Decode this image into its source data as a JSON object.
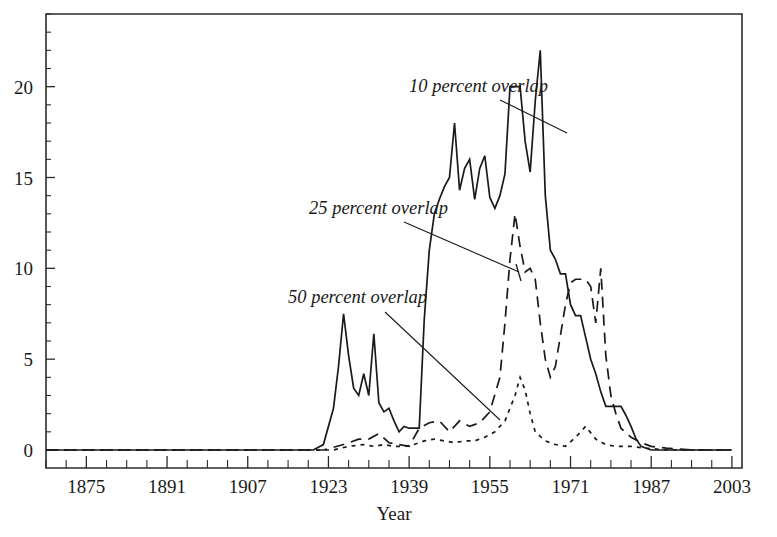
{
  "chart_data": {
    "type": "line",
    "title": "",
    "xlabel": "Year",
    "ylabel": "",
    "xlim": [
      1867,
      2005
    ],
    "ylim": [
      0,
      24
    ],
    "grid": false,
    "legend_position": "inline-annotations",
    "x_tick_labels": [
      "1875",
      "1891",
      "1907",
      "1923",
      "1939",
      "1955",
      "1971",
      "1987",
      "2003"
    ],
    "x_tick_values": [
      1875,
      1891,
      1907,
      1923,
      1939,
      1955,
      1971,
      1987,
      2003
    ],
    "x_minor_step": 4,
    "y_tick_labels": [
      "0",
      "5",
      "10",
      "15",
      "20"
    ],
    "y_tick_values": [
      0,
      5,
      10,
      15,
      20
    ],
    "y_minor_step": 1,
    "series": [
      {
        "name": "10 percent overlap",
        "style": "solid",
        "x": [
          1867,
          1875,
          1885,
          1895,
          1905,
          1915,
          1920,
          1922,
          1924,
          1925,
          1926,
          1927,
          1928,
          1929,
          1930,
          1931,
          1932,
          1933,
          1934,
          1935,
          1936,
          1937,
          1938,
          1939,
          1940,
          1941,
          1942,
          1943,
          1944,
          1945,
          1946,
          1947,
          1948,
          1949,
          1950,
          1951,
          1952,
          1953,
          1954,
          1955,
          1956,
          1957,
          1958,
          1959,
          1960,
          1961,
          1962,
          1963,
          1964,
          1965,
          1966,
          1967,
          1968,
          1969,
          1970,
          1971,
          1972,
          1973,
          1974,
          1975,
          1976,
          1977,
          1978,
          1979,
          1980,
          1981,
          1982,
          1983,
          1984,
          1985,
          1986,
          1987,
          1988,
          1989,
          1990,
          1991,
          1992,
          1993,
          1994,
          1995,
          1996,
          1997,
          1998,
          1999,
          2000,
          2003
        ],
        "y": [
          0,
          0,
          0,
          0,
          0,
          0,
          0,
          0.3,
          2.3,
          4.6,
          7.5,
          5.2,
          3.4,
          3.0,
          4.2,
          3.0,
          6.4,
          2.6,
          2.1,
          2.3,
          1.6,
          1.0,
          1.3,
          1.2,
          1.2,
          1.2,
          7.2,
          11.0,
          13.0,
          13.8,
          14.5,
          15.0,
          18.0,
          14.3,
          15.5,
          16.0,
          13.8,
          15.5,
          16.2,
          13.9,
          13.3,
          14.0,
          15.2,
          20.0,
          20.0,
          20.0,
          17.0,
          15.3,
          19.2,
          22.0,
          14.0,
          11.0,
          10.5,
          9.7,
          9.7,
          8.0,
          7.4,
          7.4,
          6.2,
          5.0,
          4.2,
          3.2,
          2.4,
          2.4,
          2.4,
          2.4,
          1.9,
          1.3,
          0.6,
          0.2,
          0.1,
          0,
          0,
          0,
          0,
          0,
          0,
          0,
          0,
          0,
          0,
          0,
          0,
          0,
          0,
          0
        ]
      },
      {
        "name": "25 percent overlap",
        "style": "dashed",
        "x": [
          1867,
          1880,
          1900,
          1915,
          1922,
          1926,
          1929,
          1931,
          1933,
          1935,
          1937,
          1939,
          1941,
          1943,
          1945,
          1947,
          1949,
          1951,
          1953,
          1955,
          1957,
          1958,
          1959,
          1960,
          1961,
          1962,
          1963,
          1964,
          1965,
          1966,
          1967,
          1968,
          1969,
          1970,
          1971,
          1972,
          1973,
          1974,
          1975,
          1976,
          1977,
          1978,
          1979,
          1980,
          1981,
          1983,
          1985,
          1987,
          1990,
          1995,
          2000,
          2003
        ],
        "y": [
          0,
          0,
          0,
          0,
          0,
          0.3,
          0.6,
          0.6,
          0.9,
          0.4,
          0.3,
          0.2,
          1.2,
          1.5,
          1.6,
          1.0,
          1.6,
          1.3,
          1.5,
          2.1,
          4.0,
          7.0,
          10.5,
          13.0,
          11.2,
          9.8,
          10.0,
          9.4,
          7.0,
          5.0,
          4.0,
          4.6,
          6.3,
          8.0,
          9.2,
          9.4,
          9.4,
          9.4,
          9.0,
          7.0,
          10.0,
          5.2,
          3.0,
          2.0,
          1.2,
          0.7,
          0.4,
          0.2,
          0.1,
          0,
          0,
          0
        ]
      },
      {
        "name": "50 percent overlap",
        "style": "dotted",
        "x": [
          1867,
          1885,
          1905,
          1920,
          1924,
          1927,
          1930,
          1932,
          1934,
          1936,
          1938,
          1940,
          1942,
          1944,
          1946,
          1948,
          1950,
          1952,
          1954,
          1956,
          1958,
          1960,
          1961,
          1962,
          1963,
          1964,
          1966,
          1968,
          1970,
          1972,
          1974,
          1976,
          1978,
          1980,
          1983,
          1986,
          1990,
          1995,
          2000,
          2003
        ],
        "y": [
          0,
          0,
          0,
          0,
          0,
          0.2,
          0.3,
          0.2,
          0.3,
          0.2,
          0.2,
          0.3,
          0.5,
          0.6,
          0.5,
          0.4,
          0.5,
          0.5,
          0.7,
          1.0,
          1.6,
          3.0,
          4.0,
          3.3,
          2.0,
          1.0,
          0.5,
          0.3,
          0.2,
          0.7,
          1.3,
          0.6,
          0.3,
          0.2,
          0.2,
          0.1,
          0,
          0,
          0,
          0
        ]
      }
    ],
    "annotations": [
      {
        "label": "10 percent overlap",
        "text_x": 409,
        "text_y": 92,
        "leader": [
          [
            500,
            100
          ],
          [
            567,
            133
          ]
        ],
        "cap": null
      },
      {
        "label": "25 percent overlap",
        "text_x": 309,
        "text_y": 214,
        "leader": [
          [
            404,
            222
          ],
          [
            519,
            272
          ]
        ],
        "cap": [
          [
            516,
            264
          ],
          [
            521,
            281
          ]
        ]
      },
      {
        "label": "50 percent overlap",
        "text_x": 288,
        "text_y": 303,
        "leader": [
          [
            385,
            312
          ],
          [
            500,
            420
          ]
        ],
        "cap": null
      }
    ]
  },
  "layout": {
    "plot_left": 46,
    "plot_right": 742,
    "plot_top": 14,
    "plot_bottom": 468,
    "baseline_y": 450,
    "y_axis_top_value": 24,
    "xaxis_title_x": 394,
    "xaxis_title_y": 520
  }
}
